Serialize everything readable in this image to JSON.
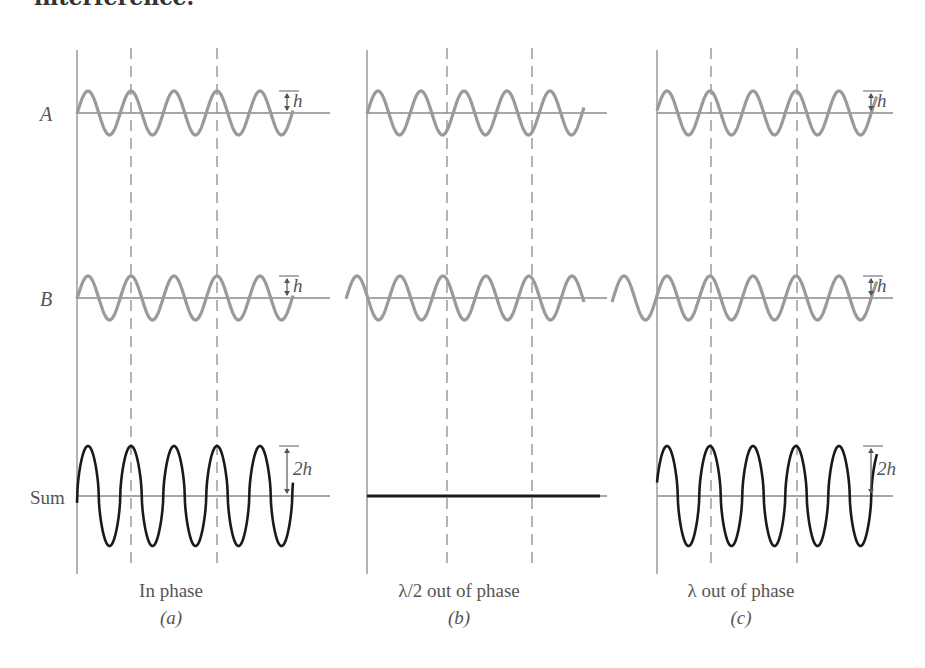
{
  "heading": "interference.",
  "rows": {
    "A": {
      "label": "A",
      "mid_y": 113
    },
    "B": {
      "label": "B",
      "mid_y": 298
    },
    "Sum": {
      "label": "Sum",
      "mid_y": 496
    }
  },
  "amplitude_h": 22,
  "wavelength": 43,
  "colors": {
    "component_wave": "#9a9a9a",
    "sum_wave": "#1a1a1a",
    "axis": "#8a8a8a",
    "dashed": "#777777",
    "text": "#555555"
  },
  "annotations": {
    "h_label": "h",
    "2h_label": "2h"
  },
  "panels": [
    {
      "id": "a",
      "caption": "In phase",
      "sublabel": "(a)",
      "axis_x": 77,
      "dashed_x": [
        131,
        217
      ],
      "midline_end": 330,
      "A": {
        "x_start": 77,
        "x_end": 293,
        "first_peak_x": 88
      },
      "B": {
        "x_start": 77,
        "x_end": 293,
        "first_peak_x": 88
      },
      "Sum": {
        "type": "wave",
        "x_start": 77,
        "x_end": 293,
        "first_peak_x": 88,
        "amplitude": 50
      },
      "show_h_markers": true
    },
    {
      "id": "b",
      "caption": "λ/2 out of phase",
      "sublabel": "(b)",
      "axis_x": 367,
      "dashed_x": [
        447,
        532
      ],
      "midline_end": 607,
      "A": {
        "x_start": 367,
        "x_end": 584,
        "first_peak_x": 378
      },
      "B": {
        "x_start": 346,
        "x_end": 584,
        "first_peak_x": 357
      },
      "Sum": {
        "type": "flat",
        "x_start": 367,
        "x_end": 600
      },
      "show_h_markers": false
    },
    {
      "id": "c",
      "caption": "λ out of phase",
      "sublabel": "(c)",
      "axis_x": 657,
      "dashed_x": [
        711,
        797
      ],
      "midline_end": 893,
      "A": {
        "x_start": 657,
        "x_end": 877,
        "first_peak_x": 667
      },
      "B": {
        "x_start": 612,
        "x_end": 877,
        "first_peak_x": 624
      },
      "Sum": {
        "type": "wave",
        "x_start": 657,
        "x_end": 877,
        "first_peak_x": 667,
        "amplitude": 50
      },
      "show_h_markers": true
    }
  ],
  "caption_y": 597,
  "sublabel_y": 624
}
